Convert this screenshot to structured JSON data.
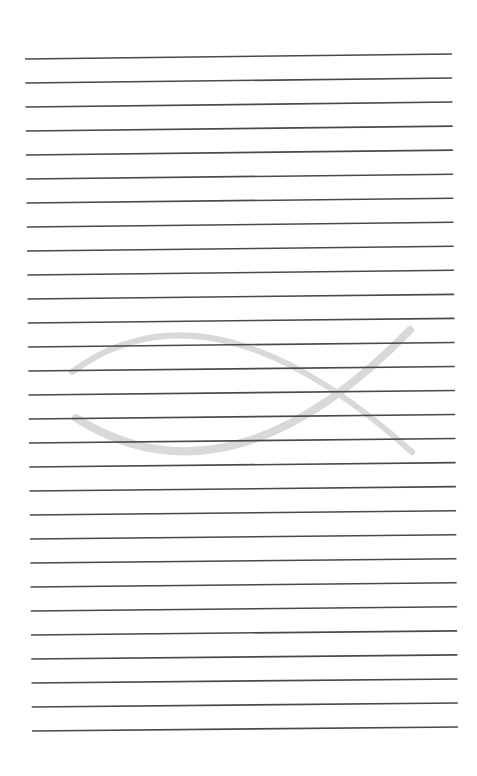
{
  "page": {
    "type": "lined-notebook-page",
    "background": "#ffffff",
    "width": 477,
    "height": 776
  },
  "ruled_lines": {
    "count": 29,
    "color": "#4a4a4a",
    "stroke_width": 1.6,
    "first": {
      "x1": 25,
      "y1": 59,
      "x2": 452,
      "y2": 54
    },
    "last": {
      "x1": 32,
      "y1": 731,
      "x2": 458,
      "y2": 727
    }
  },
  "watermark": {
    "icon": "ichthys-fish-icon",
    "color": "#d9d9d9",
    "upper_arc": {
      "start": [
        72,
        372
      ],
      "control": [
        210,
        270
      ],
      "end": [
        412,
        452
      ],
      "width": 6
    },
    "lower_arc": {
      "start": [
        76,
        418
      ],
      "control": [
        230,
        515
      ],
      "end": [
        410,
        330
      ],
      "width": 8
    }
  }
}
